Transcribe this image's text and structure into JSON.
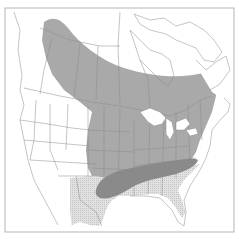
{
  "map": {
    "type": "range-map",
    "region": "North America (Canada, United States, northern Mexico)",
    "frame": {
      "x": 5,
      "y": 8,
      "width": 229,
      "height": 224
    },
    "colors": {
      "background": "#ffffff",
      "border_lines": "#8a8a8a",
      "frame": "#b5b5b5",
      "primary_range": "#a9a9a9",
      "core_range": "#8a8a8a",
      "secondary_range": "#d9d9d9"
    },
    "zones": [
      {
        "id": "primary",
        "fill_key": "primary_range",
        "pattern": "solid"
      },
      {
        "id": "core",
        "fill_key": "core_range",
        "pattern": "solid"
      },
      {
        "id": "secondary",
        "fill_key": "secondary_range",
        "pattern": "stippled"
      }
    ]
  }
}
